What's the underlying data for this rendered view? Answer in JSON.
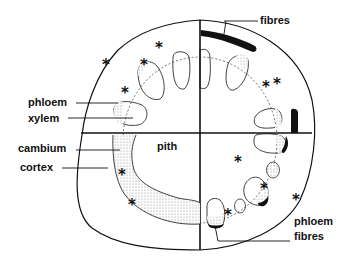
{
  "diagram": {
    "colors": {
      "ink": "#111111",
      "stipple": "#bdbdbd",
      "background": "#ffffff"
    },
    "labels": {
      "phloem": "phloem",
      "xylem": "xylem",
      "cambium": "cambium",
      "cortex": "cortex",
      "pith": "pith",
      "fibres_top": "fibres",
      "phloem_fibres_line1": "phloem",
      "phloem_fibres_line2": "fibres"
    },
    "marker_glyph": "*"
  }
}
